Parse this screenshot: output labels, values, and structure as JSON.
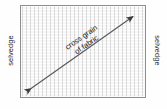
{
  "diagram": {
    "fabric": {
      "name": "fabric-panel",
      "fill_color": "#f1f1f1",
      "border_color": "#8e8e8e",
      "texture": "vertical-weave-stripes"
    },
    "labels": {
      "left_selvedge": "selvedge",
      "right_selvedge": "selvedge"
    },
    "caption": {
      "line1": "cross grain",
      "line2": "of fabric"
    },
    "arrow": {
      "name": "cross-grain-double-arrow",
      "style": "double-headed",
      "color": "#4a4a4a",
      "start_x": 28,
      "start_y": 91,
      "end_x": 136,
      "end_y": 14
    }
  }
}
